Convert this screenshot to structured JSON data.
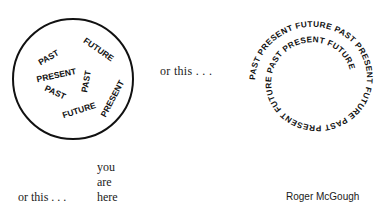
{
  "figure1": {
    "words": [
      {
        "text": "PAST",
        "x": 50,
        "y": 60,
        "rot": -30
      },
      {
        "text": "FUTURE",
        "x": 97,
        "y": 52,
        "rot": 35
      },
      {
        "text": "PRESENT",
        "x": 57,
        "y": 78,
        "rot": -12
      },
      {
        "text": "PAST",
        "x": 54,
        "y": 95,
        "rot": 25
      },
      {
        "text": "PAST",
        "x": 89,
        "y": 82,
        "rot": -80
      },
      {
        "text": "FUTURE",
        "x": 80,
        "y": 113,
        "rot": -18
      },
      {
        "text": "PRESENT",
        "x": 115,
        "y": 100,
        "rot": -62
      }
    ]
  },
  "connector1": "or this . . .",
  "figure2": {
    "spiral_text": "PAST PRESENT FUTURE PAST PRESENT FUTURE PAST PRESENT FUTURE PAST PRESENT FUTURE"
  },
  "stack": {
    "line1": "you",
    "line2": "are",
    "line3": "here"
  },
  "connector2": "or this . . .",
  "author": "Roger McGough"
}
